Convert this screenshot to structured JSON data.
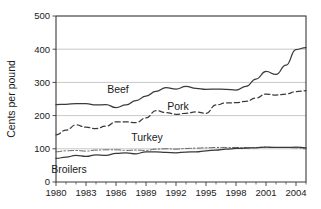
{
  "chart_data": {
    "type": "line",
    "title": "",
    "xlabel": "",
    "ylabel": "Cents per pound",
    "xlim": [
      1980,
      2005
    ],
    "ylim": [
      0,
      500
    ],
    "grid": true,
    "legend_position": "inline-labels",
    "x_ticks": [
      1980,
      1983,
      1986,
      1989,
      1992,
      1995,
      1998,
      2001,
      2004
    ],
    "x_tick_labels": [
      "1980",
      "1983",
      "1986",
      "1989",
      "1992",
      "1995",
      "1998",
      "2001",
      "2004"
    ],
    "x_minor_ticks": [
      1981,
      1982,
      1984,
      1985,
      1987,
      1988,
      1990,
      1991,
      1993,
      1994,
      1996,
      1997,
      1999,
      2000,
      2002,
      2003,
      2005
    ],
    "y_ticks": [
      0,
      100,
      200,
      300,
      400,
      500
    ],
    "y_tick_labels": [
      "0",
      "100",
      "200",
      "300",
      "400",
      "500"
    ],
    "x": [
      1980,
      1981,
      1982,
      1983,
      1984,
      1985,
      1986,
      1987,
      1988,
      1989,
      1990,
      1991,
      1992,
      1993,
      1994,
      1995,
      1996,
      1997,
      1998,
      1999,
      2000,
      2001,
      2002,
      2003,
      2004,
      2005
    ],
    "series": [
      {
        "name": "Beef",
        "label": "Beef",
        "style": "solid",
        "color": "#3a3a3a",
        "values": [
          233,
          234,
          236,
          236,
          232,
          233,
          224,
          232,
          245,
          259,
          273,
          284,
          280,
          288,
          282,
          279,
          280,
          279,
          277,
          288,
          310,
          333,
          324,
          352,
          399,
          405
        ]
      },
      {
        "name": "Pork",
        "label": "Pork",
        "style": "dashed",
        "color": "#3a3a3a",
        "values": [
          142,
          156,
          172,
          165,
          161,
          168,
          181,
          181,
          179,
          193,
          215,
          209,
          204,
          207,
          211,
          207,
          232,
          238,
          239,
          243,
          253,
          265,
          262,
          265,
          272,
          275
        ]
      },
      {
        "name": "Turkey",
        "label": "Turkey",
        "style": "dashdot",
        "color": "#5a5a5a",
        "values": [
          91,
          94,
          95,
          93,
          96,
          97,
          97,
          95,
          96,
          95,
          99,
          100,
          99,
          101,
          102,
          103,
          104,
          104,
          104,
          104,
          104,
          105,
          104,
          104,
          103,
          100
        ]
      },
      {
        "name": "Broilers",
        "label": "Broilers",
        "style": "solid",
        "color": "#3a3a3a",
        "values": [
          71,
          75,
          80,
          77,
          82,
          80,
          86,
          88,
          85,
          91,
          91,
          89,
          88,
          90,
          91,
          94,
          96,
          99,
          101,
          102,
          103,
          105,
          104,
          104,
          105,
          103
        ]
      }
    ],
    "annotations": [
      {
        "name": "beef-label",
        "text": "Beef",
        "x_px": 118,
        "y_px": 93
      },
      {
        "name": "pork-label",
        "text": "Pork",
        "x_px": 178,
        "y_px": 110
      },
      {
        "name": "turkey-label",
        "text": "Turkey",
        "x_px": 147,
        "y_px": 141
      },
      {
        "name": "broilers-label",
        "text": "Broilers",
        "x_px": 69,
        "y_px": 173
      }
    ]
  }
}
